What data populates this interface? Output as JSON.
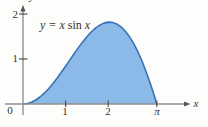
{
  "figure": {
    "equation_prefix": "y = x ",
    "equation_fn": "sin",
    "equation_suffix": " x"
  },
  "chart_data": {
    "type": "area",
    "title": "y = x sin x",
    "x_axis_label": "x",
    "y_axis_label": "y",
    "origin_label": "0",
    "x_ticks": [
      "1",
      "2",
      "π"
    ],
    "x_tick_values": [
      1,
      2,
      3.14159
    ],
    "y_ticks": [
      "1",
      "2"
    ],
    "y_tick_values": [
      1,
      2
    ],
    "xlim": [
      0,
      3.6
    ],
    "ylim": [
      0,
      2.2
    ],
    "grid": false,
    "legend": false,
    "fill_color": "#8CBAE8",
    "stroke_color": "#3A72B8",
    "axis_color": "#8F8F8F",
    "tick_color": "#444444",
    "curve": {
      "x": [
        0,
        0.1,
        0.2,
        0.3,
        0.4,
        0.5,
        0.6,
        0.7,
        0.8,
        0.9,
        1.0,
        1.1,
        1.2,
        1.3,
        1.4,
        1.5,
        1.6,
        1.7,
        1.8,
        1.9,
        2.0,
        2.1,
        2.2,
        2.3,
        2.4,
        2.5,
        2.6,
        2.7,
        2.8,
        2.9,
        3.0,
        3.1,
        3.14159
      ],
      "y": [
        0,
        0.01,
        0.04,
        0.089,
        0.156,
        0.24,
        0.339,
        0.451,
        0.574,
        0.705,
        0.841,
        0.98,
        1.118,
        1.253,
        1.38,
        1.496,
        1.599,
        1.686,
        1.753,
        1.798,
        1.819,
        1.813,
        1.779,
        1.715,
        1.621,
        1.496,
        1.34,
        1.154,
        0.938,
        0.694,
        0.423,
        0.129,
        0
      ]
    }
  }
}
